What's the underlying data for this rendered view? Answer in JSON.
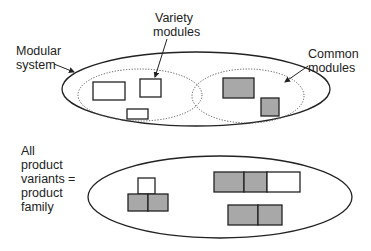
{
  "labels": {
    "modular_system_1": "Modular",
    "modular_system_2": "system",
    "variety_1": "Variety",
    "variety_2": "modules",
    "common_1": "Common",
    "common_2": "modules",
    "family_1": "All",
    "family_2": "product",
    "family_3": "variants",
    "family_4": "product",
    "family_5": "family",
    "equals": "="
  },
  "colors": {
    "stroke": "#222222",
    "module_fill_common": "#a8a8a8",
    "module_fill_variety": "#ffffff",
    "dotted": "#555555"
  }
}
